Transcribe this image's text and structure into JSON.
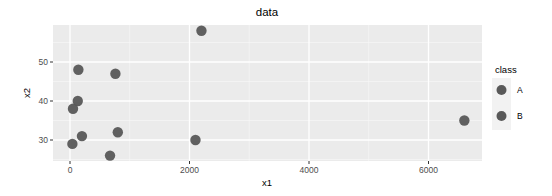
{
  "chart_data": {
    "type": "scatter",
    "title": "data",
    "xlabel": "x1",
    "ylabel": "x2",
    "xlim": [
      -250,
      6850
    ],
    "ylim": [
      24.5,
      59.5
    ],
    "x_ticks": [
      0,
      2000,
      4000,
      6000
    ],
    "x_tick_labels": [
      "0",
      "2000",
      "4000",
      "6000"
    ],
    "x_minor_ticks": [
      1000,
      3000,
      5000
    ],
    "y_ticks": [
      30,
      40,
      50
    ],
    "y_tick_labels": [
      "30",
      "40",
      "50"
    ],
    "y_minor_ticks": [
      25,
      35,
      45,
      55
    ],
    "grid": true,
    "legend": {
      "title": "class",
      "position": "right",
      "entries": [
        "A",
        "B"
      ]
    },
    "points": [
      {
        "x": 140,
        "y": 48
      },
      {
        "x": 760,
        "y": 47
      },
      {
        "x": 130,
        "y": 40
      },
      {
        "x": 50,
        "y": 38
      },
      {
        "x": 800,
        "y": 32
      },
      {
        "x": 200,
        "y": 31
      },
      {
        "x": 40,
        "y": 29
      },
      {
        "x": 670,
        "y": 26
      },
      {
        "x": 2200,
        "y": 58
      },
      {
        "x": 2100,
        "y": 30
      },
      {
        "x": 6600,
        "y": 35
      }
    ],
    "colors": {
      "panel_background": "#EBEBEB",
      "grid_major": "#FFFFFF",
      "grid_minor": "#F7F7F7",
      "point": "#595959",
      "legend_key_background": "#F2F2F2"
    }
  }
}
